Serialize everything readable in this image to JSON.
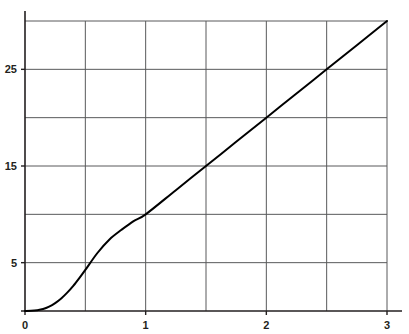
{
  "chart_data": {
    "type": "line",
    "title": "",
    "subtitle": "",
    "xlabel": "",
    "ylabel": "",
    "xlim": [
      0,
      3
    ],
    "ylim": [
      0,
      30
    ],
    "grid": true,
    "legend": null,
    "legend_position": "none",
    "annotations": [],
    "x_tick_labels": [
      "0",
      "1",
      "2",
      "3"
    ],
    "x_tick_values": [
      0,
      1,
      2,
      3
    ],
    "x_gridline_values": [
      0,
      0.5,
      1,
      1.5,
      2,
      2.5,
      3
    ],
    "y_tick_labels": [
      "5",
      "15",
      "25"
    ],
    "y_tick_values": [
      5,
      15,
      25
    ],
    "y_gridline_values": [
      5,
      10,
      15,
      20,
      25,
      30
    ],
    "series": [
      {
        "name": "curve",
        "color": "#000000",
        "line_width": 2,
        "x": [
          0.0,
          0.05,
          0.1,
          0.15,
          0.2,
          0.25,
          0.3,
          0.35,
          0.4,
          0.45,
          0.5,
          0.6,
          0.7,
          0.8,
          0.9,
          1.0,
          1.25,
          1.5,
          1.75,
          2.0,
          2.25,
          2.5,
          2.75,
          3.0
        ],
        "y": [
          0.0,
          0.02,
          0.08,
          0.2,
          0.45,
          0.82,
          1.3,
          1.9,
          2.6,
          3.4,
          4.25,
          6.0,
          7.4,
          8.4,
          9.3,
          10.0,
          12.5,
          15.0,
          17.5,
          20.0,
          22.5,
          25.0,
          27.5,
          30.0
        ]
      }
    ]
  },
  "colors": {
    "line": "#000000",
    "grid": "#58595b",
    "axis": "#231f20",
    "text": "#231f20",
    "background": "#ffffff"
  },
  "geometry": {
    "plot_left": 25,
    "plot_right": 387,
    "plot_top": 21,
    "plot_bottom": 311,
    "axis_top": 11
  }
}
